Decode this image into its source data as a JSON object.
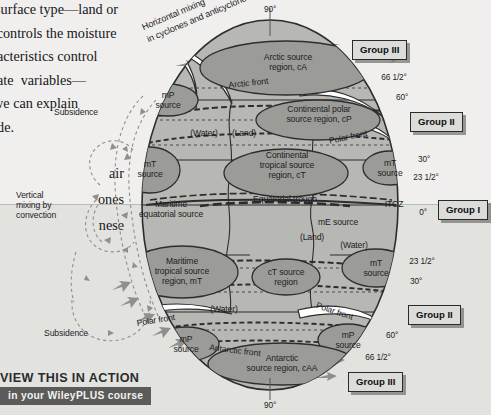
{
  "page": {
    "body_text": "s surface type—land or\nh controls the moisture\naracteristics control\nmate  variables—\n–we can explain\nuide.",
    "body_text2": "air\nones\nnese"
  },
  "figure": {
    "annotations": {
      "horizontal_mixing": "Horizontal mixing\nin cyclones and anticyclones",
      "vertical_mixing": "Vertical\nmixing by\nconvection",
      "subsidence_top": "Subsidence",
      "subsidence_bottom": "Subsidence"
    },
    "regions": [
      {
        "name": "arctic-source-region",
        "text": "Arctic source\nregion, cA"
      },
      {
        "name": "continental-polar-source-region",
        "text": "Continental polar\nsource region, cP"
      },
      {
        "name": "continental-tropical-source-region",
        "text": "Continental\ntropical source\nregion, cT"
      },
      {
        "name": "maritime-polar-source-upper-left",
        "text": "mP\nsource"
      },
      {
        "name": "maritime-tropical-source-left",
        "text": "mT\nsource"
      },
      {
        "name": "maritime-tropical-source-right-upper",
        "text": "mT\nsource"
      },
      {
        "name": "maritime-equatorial-source",
        "text": "Maritime\nequatorial source"
      },
      {
        "name": "maritime-tropical-source-region",
        "text": "Maritime\ntropical source\nregion, mT"
      },
      {
        "name": "ct-source-region",
        "text": "cT source\nregion"
      },
      {
        "name": "maritime-tropical-source-right-lower",
        "text": "mT\nsource"
      },
      {
        "name": "maritime-polar-source-lower-left",
        "text": "mP\nsource"
      },
      {
        "name": "maritime-polar-source-lower-right",
        "text": "mP\nsource"
      },
      {
        "name": "antarctic-source-region",
        "text": "Antarctic\nsource region, cAA"
      }
    ],
    "fronts": {
      "arctic_front": "Arctic front",
      "polar_front_upper_right": "Polar front",
      "polar_front_lower_left": "Polar front",
      "polar_front_lower_right": "Polar front",
      "antarctic_front": "Antarctic front",
      "equatorial_trough": "Equatorial trough",
      "itcz": "ITCZ",
      "me_source": "mE source"
    },
    "surface_types": {
      "water_upper": "(Water)",
      "land_upper": "(Land)",
      "land_lower": "(Land)",
      "water_right": "(Water)",
      "water_lower": "(Water)"
    },
    "latitudes_north": [
      "90°",
      "66 1/2°",
      "60°",
      "30°",
      "23 1/2°",
      "0°"
    ],
    "latitudes_south": [
      "23 1/2°",
      "30°",
      "60°",
      "66 1/2°",
      "90°"
    ],
    "groups": [
      {
        "name": "group-iii-north",
        "label": "Group III"
      },
      {
        "name": "group-ii-north",
        "label": "Group II"
      },
      {
        "name": "group-i",
        "label": "Group I"
      },
      {
        "name": "group-ii-south",
        "label": "Group II"
      },
      {
        "name": "group-iii-south",
        "label": "Group III"
      }
    ],
    "colors": {
      "globe_fill": "#b7b7b3",
      "source_ellipse_fill": "#9b9b97",
      "outline": "#2d2d2f",
      "background_upper": "#f0efed",
      "background_lower": "#e2e2df",
      "banner_bar": "#5b5b59"
    }
  },
  "banner": {
    "line1": "VIEW THIS IN ACTION",
    "line2": "in your WileyPLUS course"
  }
}
